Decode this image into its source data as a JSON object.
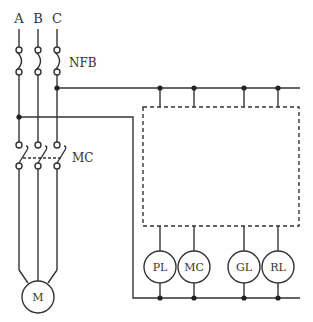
{
  "diagram": {
    "type": "electrical-schematic",
    "line_color": "#333333",
    "phases": [
      {
        "label": "A",
        "x": 19
      },
      {
        "label": "B",
        "x": 38
      },
      {
        "label": "C",
        "x": 57
      }
    ],
    "breaker": {
      "label": "NFB"
    },
    "contactor": {
      "label": "MC"
    },
    "motor": {
      "label": "M"
    },
    "control_box": {
      "style": "dashed"
    },
    "lamps": [
      {
        "label": "PL",
        "cx": 160
      },
      {
        "label": "MC",
        "cx": 194
      },
      {
        "label": "GL",
        "cx": 244
      },
      {
        "label": "RL",
        "cx": 278
      }
    ]
  }
}
